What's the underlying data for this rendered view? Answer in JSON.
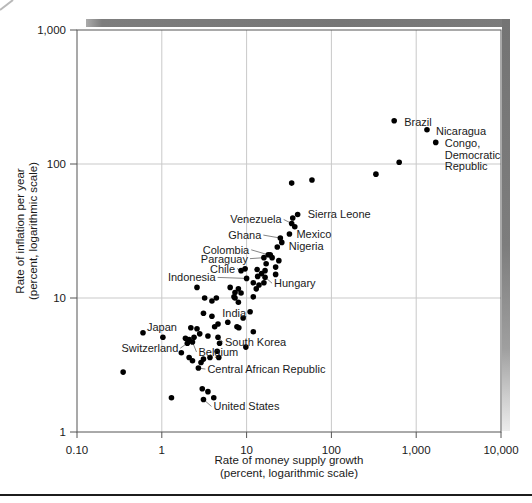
{
  "figure": {
    "x_axis": {
      "title_line1": "Rate of money supply growth",
      "title_line2": "(percent, logarithmic scale)",
      "tick_labels": [
        "0.10",
        "1",
        "10",
        "100",
        "1,000",
        "10,000"
      ],
      "tick_values": [
        0.1,
        1,
        10,
        100,
        1000,
        10000
      ]
    },
    "y_axis": {
      "title_line1": "Rate of inflation per year",
      "title_line2": "(percent, logarithmic scale)",
      "tick_labels": [
        "1,000",
        "100",
        "10",
        "1"
      ],
      "tick_values": [
        1000,
        100,
        10,
        1
      ]
    },
    "colors": {
      "dot": "#000000",
      "gridline": "#c9c9c9",
      "frame": "#555555",
      "text": "#1a1a1a",
      "shadow_bar": "#767676",
      "bottom_rule": "#1c1c1c"
    }
  },
  "chart_data": {
    "type": "scatter",
    "title": "",
    "xlabel": "Rate of money supply growth (percent, logarithmic scale)",
    "ylabel": "Rate of inflation per year (percent, logarithmic scale)",
    "x_scale": "log",
    "y_scale": "log",
    "xlim": [
      0.1,
      10000
    ],
    "ylim": [
      1,
      1000
    ],
    "grid": true,
    "points": [
      {
        "x": 550,
        "y": 210,
        "label": "Brazil",
        "anchor": "start",
        "dx": 10,
        "dy": 1
      },
      {
        "x": 1340,
        "y": 180,
        "label": "Nicaragua",
        "anchor": "start",
        "dx": 9,
        "dy": 1
      },
      {
        "x": 1700,
        "y": 145,
        "label": [
          "Congo,",
          "Democratic",
          "Republic"
        ],
        "anchor": "start",
        "dx": 9,
        "dy": 1
      },
      {
        "x": 40,
        "y": 42,
        "label": "Sierra Leone",
        "anchor": "start",
        "dx": 10,
        "dy": 0
      },
      {
        "x": 34,
        "y": 36,
        "label": "Venezuela",
        "anchor": "end",
        "dx": -10,
        "dy": -4,
        "leader": true
      },
      {
        "x": 32,
        "y": 30,
        "label": "Mexico",
        "anchor": "start",
        "dx": 7,
        "dy": 0
      },
      {
        "x": 25,
        "y": 28,
        "label": "Ghana",
        "anchor": "end",
        "dx": -19,
        "dy": -3,
        "leader": true
      },
      {
        "x": 26,
        "y": 26,
        "label": "Nigeria",
        "anchor": "start",
        "dx": 7,
        "dy": 4
      },
      {
        "x": 18,
        "y": 21,
        "label": "Colombia",
        "anchor": "end",
        "dx": -19,
        "dy": -5,
        "leader": true
      },
      {
        "x": 16,
        "y": 20,
        "label": "Paraguay",
        "anchor": "end",
        "dx": -16,
        "dy": 1,
        "leader": true
      },
      {
        "x": 8.6,
        "y": 16,
        "label": "Chile",
        "anchor": "end",
        "dx": -6,
        "dy": -2,
        "leader": true
      },
      {
        "x": 10,
        "y": 14,
        "label": "Indonesia",
        "anchor": "end",
        "dx": -31,
        "dy": -1,
        "leader": true
      },
      {
        "x": 16.5,
        "y": 14.3,
        "label": "Hungary",
        "anchor": "start",
        "dx": 9,
        "dy": 6,
        "leader": true
      },
      {
        "x": 11,
        "y": 7.9,
        "label": "India",
        "anchor": "end",
        "dx": -4,
        "dy": 1
      },
      {
        "x": 0.6,
        "y": 5.5,
        "label": "Japan",
        "anchor": "start",
        "dx": 4,
        "dy": -6
      },
      {
        "x": 4.6,
        "y": 5.1,
        "label": "South Korea",
        "anchor": "start",
        "dx": 7,
        "dy": 5,
        "leader": true
      },
      {
        "x": 2.0,
        "y": 4.6,
        "label": "Switzerland",
        "anchor": "end",
        "dx": -9,
        "dy": 5,
        "leader": true
      },
      {
        "x": 2.3,
        "y": 4.7,
        "label": "Belgium",
        "anchor": "start",
        "dx": 6,
        "dy": 10,
        "leader": true
      },
      {
        "x": 2.7,
        "y": 3.0,
        "label": "Central African Republic",
        "anchor": "start",
        "dx": 9,
        "dy": 1,
        "leader": true
      },
      {
        "x": 3.1,
        "y": 1.75,
        "label": "United States",
        "anchor": "start",
        "dx": 10,
        "dy": 7,
        "leader": true
      },
      [
        630,
        103
      ],
      [
        335,
        84
      ],
      [
        59,
        76
      ],
      [
        34,
        72
      ],
      [
        35,
        39.5
      ],
      [
        37,
        34
      ],
      [
        23,
        24
      ],
      [
        19,
        21
      ],
      [
        20,
        20
      ],
      [
        17,
        18
      ],
      [
        24,
        19
      ],
      [
        22,
        17
      ],
      [
        16.5,
        16
      ],
      [
        22,
        15
      ],
      [
        13.3,
        16.3
      ],
      [
        15,
        15.2
      ],
      [
        13.5,
        14.5
      ],
      [
        16,
        13
      ],
      [
        14,
        12.5
      ],
      [
        12,
        13
      ],
      [
        9.6,
        16.5
      ],
      [
        13,
        11.7
      ],
      [
        12,
        10.2
      ],
      [
        6.4,
        12
      ],
      [
        8,
        11.7
      ],
      [
        7.3,
        11
      ],
      [
        8.6,
        10.9
      ],
      [
        7.1,
        10.2
      ],
      [
        2.6,
        12
      ],
      [
        3.2,
        10
      ],
      [
        3.9,
        9.5
      ],
      [
        4.4,
        10
      ],
      [
        7.3,
        10
      ],
      [
        8,
        9.3
      ],
      [
        9.1,
        7.1
      ],
      [
        7.7,
        6.1
      ],
      [
        12,
        5.6
      ],
      [
        3.1,
        7.7
      ],
      [
        3.9,
        7.3
      ],
      [
        4.6,
        6.4
      ],
      [
        4.2,
        6.1
      ],
      [
        6.0,
        6.6
      ],
      [
        8.1,
        6.0
      ],
      [
        2.2,
        6.0
      ],
      [
        2.6,
        5.9
      ],
      [
        2.8,
        5.4
      ],
      [
        2.4,
        5.1
      ],
      [
        1.9,
        5.0
      ],
      [
        2.1,
        4.9
      ],
      [
        3.5,
        5.2
      ],
      [
        4.8,
        4.6
      ],
      [
        9.8,
        4.3
      ],
      [
        1.03,
        5.1
      ],
      [
        0.35,
        2.8
      ],
      [
        1.7,
        3.9
      ],
      [
        2.1,
        3.6
      ],
      [
        2.3,
        3.4
      ],
      [
        3.1,
        3.5
      ],
      [
        3.7,
        3.6
      ],
      [
        4.7,
        3.6
      ],
      [
        2.9,
        3.3
      ],
      [
        4.5,
        4.0
      ],
      [
        3.0,
        2.1
      ],
      [
        3.5,
        2.0
      ],
      [
        1.3,
        1.8
      ],
      [
        4.1,
        1.8
      ]
    ]
  }
}
